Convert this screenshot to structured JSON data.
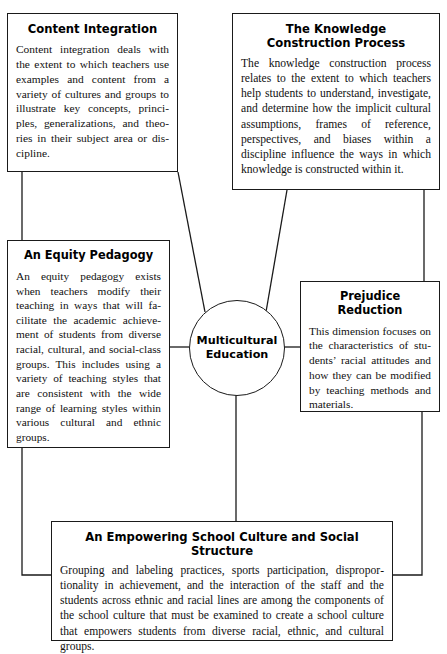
{
  "figure": {
    "type": "concept-diagram",
    "center": {
      "label": "Multicultural\nEducation",
      "shape": "circle"
    },
    "nodes": [
      {
        "id": "content-integration",
        "title": "Content Integration",
        "body": "Content integration deals with the extent to which teachers use examples and content from a variety of cultures and groups to illustrate key concepts, princi­ples, generalizations, and theo­ries in their subject area or dis­cipline."
      },
      {
        "id": "knowledge-construction",
        "title": "The Knowledge\nConstruction Process",
        "body": "The knowledge construction process relates to the extent to which teachers help students to understand, investi­gate, and determine how the implicit cultural assumptions, frames of refer­ence, perspectives, and biases within a discipline influence the ways in which knowledge is constructed within it."
      },
      {
        "id": "equity-pedagogy",
        "title": "An Equity Pedagogy",
        "body": "An equity pedagogy exists when teachers modify their teaching in ways that will fa­cilitate the academic achieve­ment of students from diverse racial, cultural, and social-class groups. This includes using a variety of teaching styles that are consistent with the wide range of learning styles within various cultural and ethnic groups."
      },
      {
        "id": "prejudice-reduction",
        "title": "Prejudice Reduction",
        "body": "This dimension focuses on the characteristics of stu­dents’ racial attitudes and how they can be modified by teaching methods and materials."
      },
      {
        "id": "empowering-culture",
        "title": "An Empowering School Culture and Social Structure",
        "body": "Grouping and labeling practices, sports participation, dispropor­tionality in achievement, and the interaction of the staff and the students across ethnic and racial lines are among the components of the school culture that must be examined to create a school culture that empowers students from diverse racial, ethnic, and cultural groups."
      }
    ],
    "colors": {
      "line": "#1a1a1a",
      "text": "#111111",
      "background": "#ffffff"
    }
  }
}
